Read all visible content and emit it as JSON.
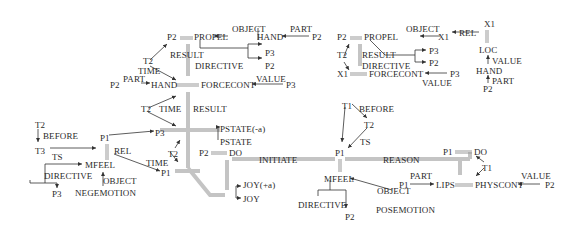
{
  "diagram": {
    "type": "conceptual-dependency",
    "colors": {
      "text": "#2a2a2a",
      "thick_link": "#bdbdbd",
      "arrow": "#333333"
    },
    "labels": [
      {
        "id": "a_p2",
        "text": "P2",
        "x": 167,
        "y": 32
      },
      {
        "id": "a_propel",
        "text": "PROPEL",
        "x": 194,
        "y": 32
      },
      {
        "id": "a_object",
        "text": "OBJECT",
        "x": 232,
        "y": 24
      },
      {
        "id": "a_hand",
        "text": "HAND",
        "x": 257,
        "y": 32
      },
      {
        "id": "a_part",
        "text": "PART",
        "x": 290,
        "y": 24
      },
      {
        "id": "a_p2b",
        "text": "P2",
        "x": 312,
        "y": 32
      },
      {
        "id": "a_result",
        "text": "RESULT",
        "x": 170,
        "y": 50
      },
      {
        "id": "a_directive",
        "text": "DIRECTIVE",
        "x": 195,
        "y": 61
      },
      {
        "id": "a_p3",
        "text": "P3",
        "x": 265,
        "y": 48
      },
      {
        "id": "a_p2c",
        "text": "P2",
        "x": 265,
        "y": 61
      },
      {
        "id": "a_t2",
        "text": "T2",
        "x": 143,
        "y": 56
      },
      {
        "id": "a_time",
        "text": "TIME",
        "x": 138,
        "y": 66
      },
      {
        "id": "a_p2d",
        "text": "P2",
        "x": 110,
        "y": 80
      },
      {
        "id": "a_part2",
        "text": "PART",
        "x": 123,
        "y": 74
      },
      {
        "id": "a_hand2",
        "text": "HAND",
        "x": 151,
        "y": 80
      },
      {
        "id": "a_forcecont",
        "text": "FORCECONT",
        "x": 201,
        "y": 80
      },
      {
        "id": "a_value",
        "text": "VALUE",
        "x": 256,
        "y": 74
      },
      {
        "id": "a_p3b",
        "text": "P3",
        "x": 286,
        "y": 80
      },
      {
        "id": "b_t2",
        "text": "T2",
        "x": 141,
        "y": 104
      },
      {
        "id": "b_time",
        "text": "TIME",
        "x": 159,
        "y": 104
      },
      {
        "id": "b_result",
        "text": "RESULT",
        "x": 193,
        "y": 104
      },
      {
        "id": "b_p3",
        "text": "P3",
        "x": 155,
        "y": 128
      },
      {
        "id": "b_pstate_neg",
        "text": "PSTATE(-a)",
        "x": 220,
        "y": 124
      },
      {
        "id": "b_pstate",
        "text": "PSTATE",
        "x": 220,
        "y": 137
      },
      {
        "id": "b_t2b",
        "text": "T2",
        "x": 168,
        "y": 149
      },
      {
        "id": "b_p2",
        "text": "P2",
        "x": 199,
        "y": 148
      },
      {
        "id": "b_do",
        "text": "DO",
        "x": 229,
        "y": 148
      },
      {
        "id": "b_initiate",
        "text": "INITIATE",
        "x": 259,
        "y": 155
      },
      {
        "id": "b_time2",
        "text": "TIME",
        "x": 146,
        "y": 158
      },
      {
        "id": "b_p1",
        "text": "P1",
        "x": 161,
        "y": 168
      },
      {
        "id": "b_joy_pos",
        "text": "JOY(+a)",
        "x": 243,
        "y": 180
      },
      {
        "id": "b_joy",
        "text": "JOY",
        "x": 243,
        "y": 194
      },
      {
        "id": "c_t2",
        "text": "T2",
        "x": 35,
        "y": 120
      },
      {
        "id": "c_before",
        "text": "BEFORE",
        "x": 43,
        "y": 131
      },
      {
        "id": "c_t3",
        "text": "T3",
        "x": 35,
        "y": 146
      },
      {
        "id": "c_ts",
        "text": "TS",
        "x": 52,
        "y": 152
      },
      {
        "id": "c_p1",
        "text": "P1",
        "x": 100,
        "y": 133
      },
      {
        "id": "c_rel",
        "text": "REL",
        "x": 114,
        "y": 146
      },
      {
        "id": "c_mfeel",
        "text": "MFEEL",
        "x": 85,
        "y": 160
      },
      {
        "id": "c_directive",
        "text": "DIRECTIVE",
        "x": 44,
        "y": 171
      },
      {
        "id": "c_object",
        "text": "OBJECT",
        "x": 103,
        "y": 176
      },
      {
        "id": "c_p3",
        "text": "P3",
        "x": 52,
        "y": 189
      },
      {
        "id": "c_negemotion",
        "text": "NEGEMOTION",
        "x": 75,
        "y": 188
      },
      {
        "id": "d_p2",
        "text": "P2",
        "x": 337,
        "y": 32
      },
      {
        "id": "d_propel",
        "text": "PROPEL",
        "x": 364,
        "y": 32
      },
      {
        "id": "d_object",
        "text": "OBJECT",
        "x": 406,
        "y": 24
      },
      {
        "id": "d_x1",
        "text": "X1",
        "x": 438,
        "y": 32
      },
      {
        "id": "d_rel",
        "text": "REL",
        "x": 459,
        "y": 28
      },
      {
        "id": "d_x1top",
        "text": "X1",
        "x": 484,
        "y": 19
      },
      {
        "id": "d_t2",
        "text": "T2",
        "x": 337,
        "y": 50
      },
      {
        "id": "d_result",
        "text": "RESULT",
        "x": 362,
        "y": 50
      },
      {
        "id": "d_directive",
        "text": "DIRECTIVE",
        "x": 362,
        "y": 61
      },
      {
        "id": "d_p3",
        "text": "P3",
        "x": 429,
        "y": 46
      },
      {
        "id": "d_p2b",
        "text": "P2",
        "x": 429,
        "y": 58
      },
      {
        "id": "d_x1b",
        "text": "X1",
        "x": 337,
        "y": 69
      },
      {
        "id": "d_forcecont",
        "text": "FORCECONT",
        "x": 369,
        "y": 69
      },
      {
        "id": "d_p3b",
        "text": "P3",
        "x": 450,
        "y": 69
      },
      {
        "id": "d_value",
        "text": "VALUE",
        "x": 422,
        "y": 78
      },
      {
        "id": "d_loc",
        "text": "LOC",
        "x": 479,
        "y": 45
      },
      {
        "id": "d_value2",
        "text": "VALUE",
        "x": 492,
        "y": 56
      },
      {
        "id": "d_hand",
        "text": "HAND",
        "x": 476,
        "y": 66
      },
      {
        "id": "d_part",
        "text": "PART",
        "x": 492,
        "y": 76
      },
      {
        "id": "d_p2c",
        "text": "P2",
        "x": 483,
        "y": 84
      },
      {
        "id": "e_t1",
        "text": "T1",
        "x": 342,
        "y": 101
      },
      {
        "id": "e_before",
        "text": "BEFORE",
        "x": 359,
        "y": 104
      },
      {
        "id": "e_t2",
        "text": "T2",
        "x": 364,
        "y": 120
      },
      {
        "id": "e_ts",
        "text": "TS",
        "x": 360,
        "y": 137
      },
      {
        "id": "e_p1",
        "text": "P1",
        "x": 335,
        "y": 148
      },
      {
        "id": "e_reason",
        "text": "REASON",
        "x": 383,
        "y": 155
      },
      {
        "id": "e_mfeel",
        "text": "MFEEL",
        "x": 324,
        "y": 174
      },
      {
        "id": "e_directive",
        "text": "DIRECTIVE",
        "x": 298,
        "y": 200
      },
      {
        "id": "e_p2",
        "text": "P2",
        "x": 345,
        "y": 212
      },
      {
        "id": "e_object",
        "text": "OBJECT",
        "x": 377,
        "y": 186
      },
      {
        "id": "e_posemotion",
        "text": "POSEMOTION",
        "x": 376,
        "y": 205
      },
      {
        "id": "e_part",
        "text": "PART",
        "x": 410,
        "y": 171
      },
      {
        "id": "e_p1b",
        "text": "P1",
        "x": 399,
        "y": 180
      },
      {
        "id": "e_lips",
        "text": "LIPS",
        "x": 436,
        "y": 180
      },
      {
        "id": "f_p1",
        "text": "P1",
        "x": 443,
        "y": 147
      },
      {
        "id": "f_do",
        "text": "DO",
        "x": 474,
        "y": 147
      },
      {
        "id": "f_t1",
        "text": "T1",
        "x": 482,
        "y": 163
      },
      {
        "id": "f_physcont",
        "text": "PHYSCONT",
        "x": 475,
        "y": 180
      },
      {
        "id": "f_value",
        "text": "VALUE",
        "x": 521,
        "y": 171
      },
      {
        "id": "f_p2",
        "text": "P2",
        "x": 545,
        "y": 180
      }
    ]
  }
}
